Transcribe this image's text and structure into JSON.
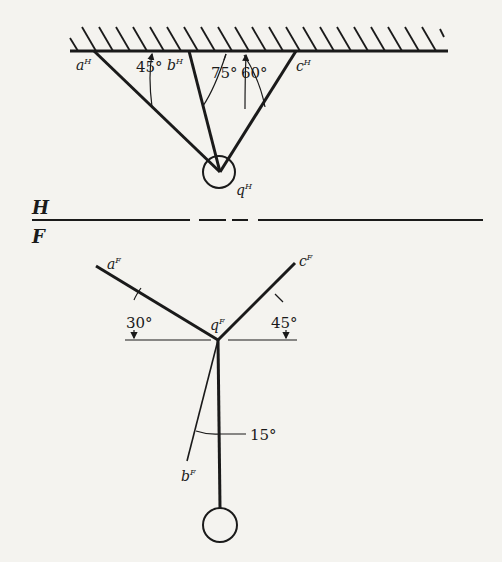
{
  "views": {
    "top": {
      "label": "H",
      "points": {
        "a": "a",
        "b": "b",
        "c": "c",
        "q": "q"
      },
      "superscript": "H",
      "angles": {
        "a": "45°",
        "b": "75°",
        "c": "60°"
      }
    },
    "front": {
      "label": "F",
      "points": {
        "a": "a",
        "b": "b",
        "c": "c",
        "q": "q"
      },
      "superscript": "F",
      "angles": {
        "a": "30°",
        "c": "45°",
        "b": "15°"
      }
    }
  },
  "colors": {
    "ink": "#1a1a1a",
    "paper": "#f4f3ef"
  }
}
